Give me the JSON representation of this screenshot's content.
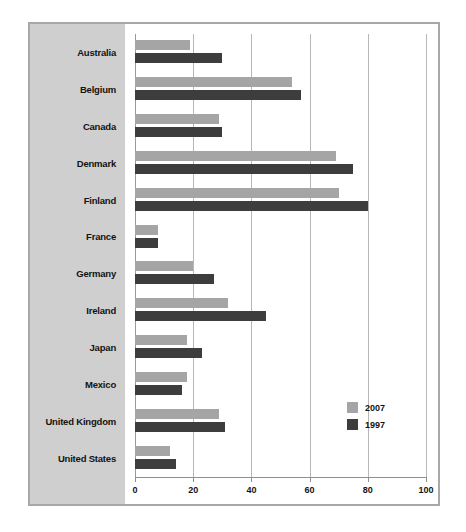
{
  "chart_data": {
    "type": "bar",
    "orientation": "horizontal",
    "title": "",
    "subtitle": "",
    "xlabel": "",
    "ylabel": "",
    "xlim": [
      0,
      100
    ],
    "xticks": [
      0,
      20,
      40,
      60,
      80,
      100
    ],
    "xtick_labels": [
      "0",
      "20",
      "40",
      "60",
      "80",
      "100"
    ],
    "grid": true,
    "legend_position": "bottom-right",
    "categories": [
      "Australia",
      "Belgium",
      "Canada",
      "Denmark",
      "Finland",
      "France",
      "Germany",
      "Ireland",
      "Japan",
      "Mexico",
      "United Kingdom",
      "United States"
    ],
    "series": [
      {
        "name": "2007",
        "color": "#a5a5a5",
        "values": [
          19,
          54,
          29,
          69,
          70,
          8,
          20,
          32,
          18,
          18,
          29,
          12
        ]
      },
      {
        "name": "1997",
        "color": "#3d3d3d",
        "values": [
          30,
          57,
          30,
          75,
          80,
          8,
          27,
          45,
          23,
          16,
          31,
          14
        ]
      }
    ]
  },
  "legend": {
    "entries": [
      {
        "label": "2007",
        "color": "#a5a5a5"
      },
      {
        "label": "1997",
        "color": "#3d3d3d"
      }
    ]
  },
  "colors": {
    "series_2007": "#a5a5a5",
    "series_1997": "#3d3d3d",
    "label_panel": "#cfcfcf",
    "frame_border": "#a8a8a8",
    "gridline": "#b7b7b7",
    "plot_background": "#ffffff",
    "text": "#131313"
  }
}
